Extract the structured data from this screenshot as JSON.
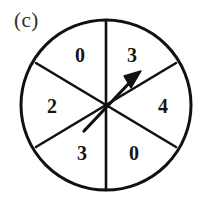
{
  "figure": {
    "part_label": "(c)",
    "type": "spinner-wheel",
    "colors": {
      "background": "#ffffff",
      "outline": "#111111",
      "divider": "#111111",
      "text": "#161616",
      "label": "#2b2b2b",
      "pointer": "#111111"
    },
    "circle": {
      "center_x": 106,
      "center_y": 105,
      "radius": 85,
      "stroke_width": 3
    },
    "sectors": [
      {
        "id": "top-left",
        "value": "0",
        "label_x": 80,
        "label_y": 55,
        "start_deg": 210,
        "end_deg": 270
      },
      {
        "id": "top-right",
        "value": "3",
        "label_x": 132,
        "label_y": 55,
        "start_deg": 270,
        "end_deg": 330
      },
      {
        "id": "left",
        "value": "2",
        "label_x": 52,
        "label_y": 106,
        "start_deg": 150,
        "end_deg": 210
      },
      {
        "id": "right",
        "value": "4",
        "label_x": 163,
        "label_y": 106,
        "start_deg": 330,
        "end_deg": 30
      },
      {
        "id": "bottom-left",
        "value": "3",
        "label_x": 82,
        "label_y": 153,
        "start_deg": 90,
        "end_deg": 150
      },
      {
        "id": "bottom-right",
        "value": "0",
        "label_x": 134,
        "label_y": 153,
        "start_deg": 30,
        "end_deg": 90
      }
    ],
    "dividers": [
      {
        "id": "vertical-diameter",
        "x1": 106,
        "y1": 20,
        "x2": 106,
        "y2": 190
      },
      {
        "id": "diagonal-nw-se",
        "x1": 36,
        "y1": 63,
        "x2": 176,
        "y2": 147
      },
      {
        "id": "diagonal-ne-sw",
        "x1": 176,
        "y1": 63,
        "x2": 36,
        "y2": 147
      }
    ],
    "pointer": {
      "id": "spinner-arrow",
      "tail_x": 84,
      "tail_y": 131,
      "tip_x": 141,
      "tip_y": 71,
      "points_to_sector": "top-right",
      "points_to_value": "3",
      "shaft_width": 3
    }
  }
}
